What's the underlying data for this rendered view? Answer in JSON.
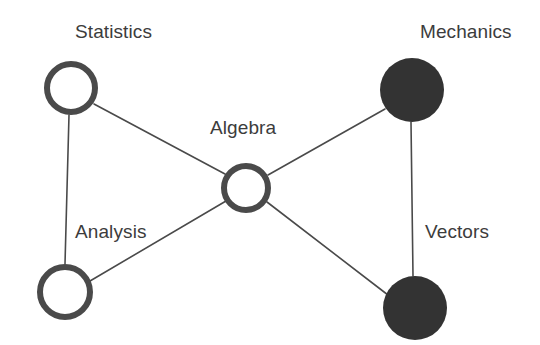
{
  "diagram": {
    "type": "node-link-graph",
    "title": "",
    "background_color": "#ffffff",
    "label_color": "#3c3c3c",
    "edge_color": "#4a4a4a",
    "ring_stroke_color": "#4a4a4a",
    "filled_node_color": "#333333",
    "nodes": [
      {
        "id": "statistics",
        "label": "Statistics",
        "style": "hollow-ring",
        "cx": 71,
        "cy": 88,
        "r": 27,
        "stroke_width": 6,
        "fill": "#ffffff",
        "stroke": "#4a4a4a",
        "label_x": 75,
        "label_y": 22
      },
      {
        "id": "algebra",
        "label": "Algebra",
        "style": "hollow-ring",
        "cx": 246,
        "cy": 188,
        "r": 25,
        "stroke_width": 6,
        "fill": "#ffffff",
        "stroke": "#4a4a4a",
        "label_x": 210,
        "label_y": 118
      },
      {
        "id": "mechanics",
        "label": "Mechanics",
        "style": "filled",
        "cx": 412,
        "cy": 90,
        "r": 32,
        "stroke_width": 0,
        "fill": "#333333",
        "stroke": "#333333",
        "label_x": 420,
        "label_y": 22
      },
      {
        "id": "analysis",
        "label": "Analysis",
        "style": "hollow-ring",
        "cx": 65,
        "cy": 292,
        "r": 28,
        "stroke_width": 6,
        "fill": "#ffffff",
        "stroke": "#4a4a4a",
        "label_x": 75,
        "label_y": 222
      },
      {
        "id": "vectors",
        "label": "Vectors",
        "style": "filled",
        "cx": 415,
        "cy": 308,
        "r": 32,
        "stroke_width": 0,
        "fill": "#333333",
        "stroke": "#333333",
        "label_x": 425,
        "label_y": 222
      }
    ],
    "edges": [
      {
        "id": "statistics-analysis",
        "source": "statistics",
        "target": "analysis",
        "x1": 69,
        "y1": 115,
        "x2": 65,
        "y2": 264,
        "width": 1.6
      },
      {
        "id": "statistics-algebra",
        "source": "statistics",
        "target": "algebra",
        "x1": 94,
        "y1": 104,
        "x2": 225,
        "y2": 174,
        "width": 1.6
      },
      {
        "id": "analysis-algebra",
        "source": "analysis",
        "target": "algebra",
        "x1": 90,
        "y1": 281,
        "x2": 226,
        "y2": 201,
        "width": 1.6
      },
      {
        "id": "algebra-mechanics",
        "source": "algebra",
        "target": "mechanics",
        "x1": 268,
        "y1": 175,
        "x2": 385,
        "y2": 109,
        "width": 1.6
      },
      {
        "id": "algebra-vectors",
        "source": "algebra",
        "target": "vectors",
        "x1": 267,
        "y1": 202,
        "x2": 388,
        "y2": 295,
        "width": 1.6
      },
      {
        "id": "mechanics-vectors",
        "source": "mechanics",
        "target": "vectors",
        "x1": 411,
        "y1": 122,
        "x2": 413,
        "y2": 276,
        "width": 1.6
      }
    ]
  }
}
